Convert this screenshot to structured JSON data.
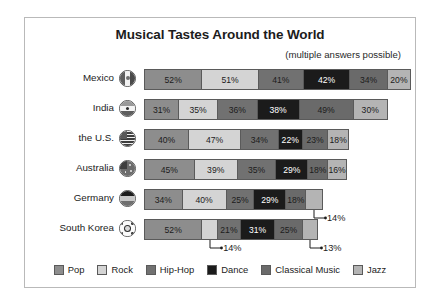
{
  "chart_data": {
    "type": "bar",
    "subtype": "stacked-horizontal",
    "title": "Musical Tastes Around the World",
    "subtitle": "(multiple answers possible)",
    "xlabel": "",
    "ylabel": "",
    "grid": false,
    "legend_position": "bottom",
    "categories": [
      "Mexico",
      "India",
      "the U.S.",
      "Australia",
      "Germany",
      "South Korea"
    ],
    "series": [
      {
        "name": "Pop",
        "color": "#8d8d8d",
        "text_color": "#1c1c1c",
        "values": [
          52,
          31,
          40,
          45,
          34,
          52
        ]
      },
      {
        "name": "Rock",
        "color": "#d4d4d4",
        "text_color": "#1c1c1c",
        "values": [
          51,
          35,
          47,
          39,
          40,
          14
        ]
      },
      {
        "name": "Hip-Hop",
        "color": "#717171",
        "text_color": "#1c1c1c",
        "values": [
          41,
          36,
          34,
          35,
          25,
          21
        ]
      },
      {
        "name": "Dance",
        "color": "#1b1b1b",
        "text_color": "#ffffff",
        "values": [
          42,
          38,
          22,
          29,
          29,
          31
        ]
      },
      {
        "name": "Classical Music",
        "color": "#6a6a6a",
        "text_color": "#1c1c1c",
        "values": [
          34,
          49,
          23,
          18,
          18,
          25
        ]
      },
      {
        "name": "Jazz",
        "color": "#b4b4b4",
        "text_color": "#1c1c1c",
        "values": [
          20,
          30,
          18,
          16,
          14,
          13
        ]
      }
    ],
    "rows": [
      {
        "label": "Mexico",
        "flag": "mexico-flag-icon",
        "segments": [
          {
            "series": "Pop",
            "value": 52,
            "label": "52%",
            "labeled": true
          },
          {
            "series": "Rock",
            "value": 51,
            "label": "51%",
            "labeled": true
          },
          {
            "series": "Hip-Hop",
            "value": 41,
            "label": "41%",
            "labeled": true
          },
          {
            "series": "Dance",
            "value": 42,
            "label": "42%",
            "labeled": true
          },
          {
            "series": "Classical Music",
            "value": 34,
            "label": "34%",
            "labeled": true
          },
          {
            "series": "Jazz",
            "value": 20,
            "label": "20%",
            "labeled": true
          }
        ],
        "total": 240
      },
      {
        "label": "India",
        "flag": "india-flag-icon",
        "segments": [
          {
            "series": "Pop",
            "value": 31,
            "label": "31%",
            "labeled": true
          },
          {
            "series": "Rock",
            "value": 35,
            "label": "35%",
            "labeled": true
          },
          {
            "series": "Hip-Hop",
            "value": 36,
            "label": "36%",
            "labeled": true
          },
          {
            "series": "Dance",
            "value": 38,
            "label": "38%",
            "labeled": true
          },
          {
            "series": "Classical Music",
            "value": 49,
            "label": "49%",
            "labeled": true
          },
          {
            "series": "Jazz",
            "value": 30,
            "label": "30%",
            "labeled": true
          }
        ],
        "total": 219
      },
      {
        "label": "the U.S.",
        "flag": "usa-flag-icon",
        "segments": [
          {
            "series": "Pop",
            "value": 40,
            "label": "40%",
            "labeled": true
          },
          {
            "series": "Rock",
            "value": 47,
            "label": "47%",
            "labeled": true
          },
          {
            "series": "Hip-Hop",
            "value": 34,
            "label": "34%",
            "labeled": true
          },
          {
            "series": "Dance",
            "value": 22,
            "label": "22%",
            "labeled": true
          },
          {
            "series": "Classical Music",
            "value": 23,
            "label": "23%",
            "labeled": true
          },
          {
            "series": "Jazz",
            "value": 18,
            "label": "18%",
            "labeled": true
          }
        ],
        "total": 184
      },
      {
        "label": "Australia",
        "flag": "australia-flag-icon",
        "segments": [
          {
            "series": "Pop",
            "value": 45,
            "label": "45%",
            "labeled": true
          },
          {
            "series": "Rock",
            "value": 39,
            "label": "39%",
            "labeled": true
          },
          {
            "series": "Hip-Hop",
            "value": 35,
            "label": "35%",
            "labeled": true
          },
          {
            "series": "Dance",
            "value": 29,
            "label": "29%",
            "labeled": true
          },
          {
            "series": "Classical Music",
            "value": 18,
            "label": "18%",
            "labeled": true
          },
          {
            "series": "Jazz",
            "value": 16,
            "label": "16%",
            "labeled": true
          }
        ],
        "total": 182
      },
      {
        "label": "Germany",
        "flag": "germany-flag-icon",
        "segments": [
          {
            "series": "Pop",
            "value": 34,
            "label": "34%",
            "labeled": true
          },
          {
            "series": "Rock",
            "value": 40,
            "label": "40%",
            "labeled": true
          },
          {
            "series": "Hip-Hop",
            "value": 25,
            "label": "25%",
            "labeled": true
          },
          {
            "series": "Dance",
            "value": 29,
            "label": "29%",
            "labeled": true
          },
          {
            "series": "Classical Music",
            "value": 18,
            "label": "18%",
            "labeled": true
          },
          {
            "series": "Jazz",
            "value": 14,
            "label": "14%",
            "labeled": false,
            "callout": true
          }
        ],
        "total": 160
      },
      {
        "label": "South Korea",
        "flag": "south-korea-flag-icon",
        "segments": [
          {
            "series": "Pop",
            "value": 52,
            "label": "52%",
            "labeled": true
          },
          {
            "series": "Rock",
            "value": 14,
            "label": "14%",
            "labeled": false,
            "callout": true
          },
          {
            "series": "Hip-Hop",
            "value": 21,
            "label": "21%",
            "labeled": true
          },
          {
            "series": "Dance",
            "value": 31,
            "label": "31%",
            "labeled": true
          },
          {
            "series": "Classical Music",
            "value": 25,
            "label": "25%",
            "labeled": true
          },
          {
            "series": "Jazz",
            "value": 13,
            "label": "13%",
            "labeled": false,
            "callout": true
          }
        ],
        "total": 156
      }
    ]
  },
  "legend": {
    "items": [
      {
        "label": "Pop",
        "color": "#8d8d8d"
      },
      {
        "label": "Rock",
        "color": "#d4d4d4"
      },
      {
        "label": "Hip-Hop",
        "color": "#717171"
      },
      {
        "label": "Dance",
        "color": "#1b1b1b"
      },
      {
        "label": "Classical Music",
        "color": "#6a6a6a"
      },
      {
        "label": "Jazz",
        "color": "#b4b4b4"
      }
    ]
  }
}
